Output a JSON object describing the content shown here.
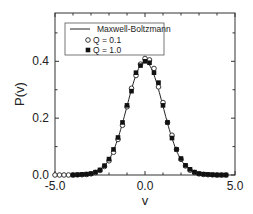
{
  "chart_data": {
    "type": "scatter",
    "title": "",
    "xlabel": "v",
    "ylabel": "P(v)",
    "xlim": [
      -5.0,
      5.0
    ],
    "ylim": [
      0.0,
      0.57
    ],
    "grid": false,
    "legend_position": "upper-left",
    "x_ticks": [
      -5.0,
      0.0,
      5.0
    ],
    "x_tick_labels": [
      "-5.0",
      "0.0",
      "5.0"
    ],
    "x_minor_ticks": [
      -4,
      -3,
      -2,
      -1,
      1,
      2,
      3,
      4
    ],
    "y_ticks": [
      0.0,
      0.2,
      0.4
    ],
    "y_tick_labels": [
      "0.0",
      "0.2",
      "0.4"
    ],
    "y_minor_ticks": [
      0.1,
      0.3,
      0.5
    ],
    "legend": [
      "Maxwell-Boltzmann",
      "Q = 0.1",
      "Q = 1.0"
    ],
    "series": [
      {
        "name": "Maxwell-Boltzmann",
        "style": "line",
        "formula": "exp(-v^2/2)/sqrt(2*pi)",
        "x": [
          -4.5,
          -4.0,
          -3.5,
          -3.0,
          -2.75,
          -2.5,
          -2.25,
          -2.0,
          -1.75,
          -1.5,
          -1.25,
          -1.0,
          -0.75,
          -0.5,
          -0.25,
          0.0,
          0.25,
          0.5,
          0.75,
          1.0,
          1.25,
          1.5,
          1.75,
          2.0,
          2.25,
          2.5,
          2.75,
          3.0,
          3.5,
          4.0,
          4.5
        ],
        "values": [
          0.0,
          0.0001,
          0.0009,
          0.0044,
          0.0091,
          0.0175,
          0.0317,
          0.054,
          0.0863,
          0.1295,
          0.1826,
          0.242,
          0.3011,
          0.3521,
          0.3867,
          0.3989,
          0.3867,
          0.3521,
          0.3011,
          0.242,
          0.1826,
          0.1295,
          0.0863,
          0.054,
          0.0317,
          0.0175,
          0.0091,
          0.0044,
          0.0009,
          0.0001,
          0.0
        ]
      },
      {
        "name": "Q = 0.1",
        "style": "open-circle",
        "x": [
          -5.0,
          -4.75,
          -4.5,
          -4.25,
          -4.0,
          -3.75,
          -3.5,
          -3.25,
          -3.0,
          -2.75,
          -2.5,
          -2.25,
          -2.0,
          -1.75,
          -1.5,
          -1.25,
          -1.0,
          -0.75,
          -0.5,
          -0.25,
          0.0,
          0.25,
          0.5,
          0.75,
          1.0,
          1.25,
          1.5,
          1.75,
          2.0,
          2.25,
          2.5,
          2.75,
          3.0,
          3.25,
          3.5,
          3.75,
          4.0,
          4.25,
          4.5
        ],
        "values": [
          0.0,
          0.0,
          0.0,
          0.0,
          0.0,
          0.0005,
          0.001,
          0.002,
          0.004,
          0.009,
          0.016,
          0.03,
          0.05,
          0.08,
          0.125,
          0.175,
          0.24,
          0.305,
          0.35,
          0.39,
          0.41,
          0.405,
          0.375,
          0.31,
          0.255,
          0.185,
          0.14,
          0.09,
          0.055,
          0.032,
          0.017,
          0.009,
          0.004,
          0.002,
          0.001,
          0.0005,
          0.0,
          0.0,
          0.0
        ]
      },
      {
        "name": "Q = 1.0",
        "style": "filled-square",
        "x": [
          -4.0,
          -3.75,
          -3.5,
          -3.25,
          -3.0,
          -2.75,
          -2.5,
          -2.25,
          -2.0,
          -1.75,
          -1.5,
          -1.25,
          -1.0,
          -0.75,
          -0.5,
          -0.25,
          0.0,
          0.25,
          0.5,
          0.75,
          1.0,
          1.25,
          1.5,
          1.75,
          2.0,
          2.25,
          2.5,
          2.75,
          3.0,
          3.25,
          3.5,
          3.75,
          4.0,
          4.25,
          4.5
        ],
        "values": [
          0.0,
          0.001,
          0.002,
          0.003,
          0.005,
          0.01,
          0.018,
          0.033,
          0.056,
          0.09,
          0.132,
          0.185,
          0.245,
          0.295,
          0.36,
          0.385,
          0.4,
          0.395,
          0.36,
          0.325,
          0.245,
          0.185,
          0.13,
          0.09,
          0.058,
          0.034,
          0.02,
          0.01,
          0.005,
          0.003,
          0.002,
          0.001,
          0.0,
          0.0,
          0.0
        ]
      }
    ]
  },
  "labels": {
    "xlabel": "v",
    "ylabel": "P(v)",
    "legend_line": "Maxwell-Boltzmann",
    "legend_open": "Q = 0.1",
    "legend_filled": "Q = 1.0"
  }
}
